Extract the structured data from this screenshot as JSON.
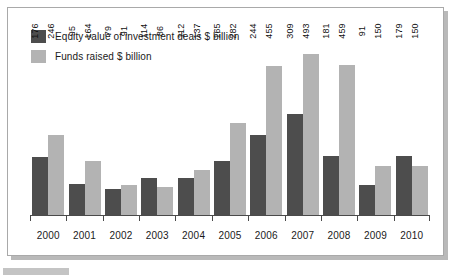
{
  "chart_data": {
    "type": "bar",
    "title": "",
    "subtitle": "",
    "xlabel": "",
    "ylabel": "",
    "grid": false,
    "legend_position": "top-left",
    "ylim": [
      0,
      520
    ],
    "categories": [
      "2000",
      "2001",
      "2002",
      "2003",
      "2004",
      "2005",
      "2006",
      "2007",
      "2008",
      "2009",
      "2010"
    ],
    "series": [
      {
        "name": "Equity value of investment deals $ billion",
        "color": "#4d4d4d",
        "values": [
          176,
          95,
          79,
          114,
          112,
          165,
          244,
          309,
          181,
          91,
          179
        ]
      },
      {
        "name": "Funds raised $ billion",
        "color": "#b3b3b3",
        "values": [
          246,
          164,
          91,
          86,
          137,
          282,
          455,
          493,
          459,
          150,
          150
        ]
      }
    ]
  },
  "legend": {
    "items": [
      {
        "label": "Equity value of investment deals $ billion",
        "color": "#4d4d4d"
      },
      {
        "label": "Funds raised $ billion",
        "color": "#b3b3b3"
      }
    ]
  }
}
